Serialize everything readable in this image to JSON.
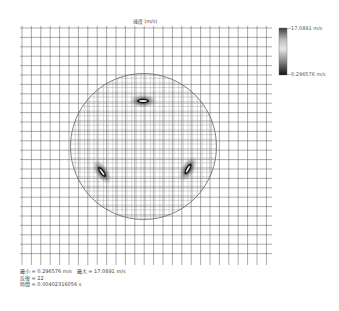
{
  "title": "速度 (m/s)",
  "colorbar": {
    "max_label": "17.0891 m/s",
    "min_label": "0.296576 m/s",
    "top_color": "#4a4a4a",
    "mid_color": "#d8d8d8",
    "bottom_color": "#1a1a1a"
  },
  "footer": {
    "line1": "最小 = 0.296576 m/s   最大 = 17.0891 m/s",
    "line2": "反復 = 22",
    "line3": "時間 = 0.00402316056 s"
  },
  "mesh": {
    "x0": 22,
    "y0": 28,
    "x1": 270,
    "y1": 262,
    "spacing": 9.4,
    "line_color": "#555555",
    "circle": {
      "cx": 143.5,
      "cy": 146.5,
      "r": 73
    },
    "hotspots": [
      {
        "name": "top",
        "x": 143,
        "y": 101,
        "angle": 0
      },
      {
        "name": "left",
        "x": 102,
        "y": 172,
        "angle": 55
      },
      {
        "name": "right",
        "x": 188,
        "y": 169,
        "angle": -60
      }
    ]
  }
}
